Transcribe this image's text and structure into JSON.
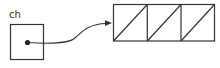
{
  "variable": {
    "name": "ch"
  },
  "array": {
    "cells": 3
  },
  "colors": {
    "stroke": "#333333",
    "background": "#ffffff"
  }
}
